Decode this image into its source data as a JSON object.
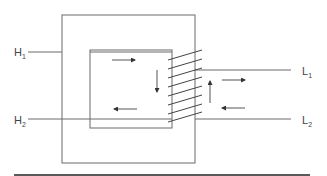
{
  "diagram": {
    "type": "transformer-core-schematic",
    "colors": {
      "line": "#6a6a6a",
      "arrow": "#333333",
      "rule": "#222222"
    },
    "labels": {
      "h1": {
        "main": "H",
        "sub": "1"
      },
      "h2": {
        "main": "H",
        "sub": "2"
      },
      "l1": {
        "main": "L",
        "sub": "1"
      },
      "l2": {
        "main": "L",
        "sub": "2"
      }
    },
    "coil_turns": 8,
    "arrows": [
      {
        "id": "top-right",
        "direction": "right"
      },
      {
        "id": "inner-down",
        "direction": "down"
      },
      {
        "id": "bottom-left",
        "direction": "left"
      },
      {
        "id": "outer-up",
        "direction": "up"
      },
      {
        "id": "outer-right",
        "direction": "right"
      },
      {
        "id": "outer-left",
        "direction": "left"
      }
    ]
  }
}
